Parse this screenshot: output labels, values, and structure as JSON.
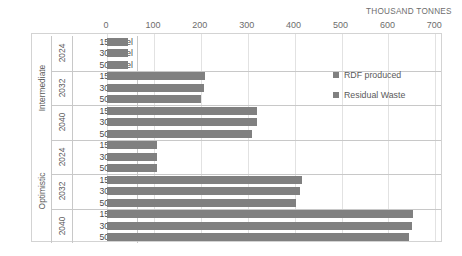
{
  "axis": {
    "units_caption": "THOUSAND TONNES",
    "ticks": [
      0,
      100,
      200,
      300,
      400,
      500,
      600,
      700
    ]
  },
  "legend": {
    "items": [
      {
        "label": "RDF produced",
        "color": "#808080"
      },
      {
        "label": "Residual Waste",
        "color": "#808080"
      }
    ]
  },
  "labels": {
    "scenario_intermediate": "Intermediate",
    "scenario_optimistic": "Optimistic",
    "year_2024": "2024",
    "year_2032": "2032",
    "year_2040": "2040",
    "fuel_15": "15% fuel",
    "fuel_30": "30% fuel",
    "fuel_50": "50% fuel"
  },
  "chart_data": {
    "type": "bar",
    "orientation": "horizontal",
    "title": "",
    "xlabel": "THOUSAND TONNES",
    "ylabel": "",
    "xlim": [
      0,
      700
    ],
    "grid": true,
    "legend_position": "inside-right",
    "xticks": [
      0,
      100,
      200,
      300,
      400,
      500,
      600,
      700
    ],
    "categories": [
      "Intermediate / 2024 / 15% fuel",
      "Intermediate / 2024 / 30% fuel",
      "Intermediate / 2024 / 50% fuel",
      "Intermediate / 2032 / 15% fuel",
      "Intermediate / 2032 / 30% fuel",
      "Intermediate / 2032 / 50% fuel",
      "Intermediate / 2040 / 15% fuel",
      "Intermediate / 2040 / 30% fuel",
      "Intermediate / 2040 / 50% fuel",
      "Optimistic / 2024 / 15% fuel",
      "Optimistic / 2024 / 30% fuel",
      "Optimistic / 2024 / 50% fuel",
      "Optimistic / 2032 / 15% fuel",
      "Optimistic / 2032 / 30% fuel",
      "Optimistic / 2032 / 50% fuel",
      "Optimistic / 2040 / 15% fuel",
      "Optimistic / 2040 / 30% fuel",
      "Optimistic / 2040 / 50% fuel"
    ],
    "series": [
      {
        "name": "Residual Waste",
        "color": "#808080",
        "values": [
          45,
          44,
          44,
          208,
          206,
          200,
          319,
          319,
          310,
          107,
          107,
          106,
          415,
          411,
          402,
          653,
          651,
          643
        ]
      }
    ],
    "groups": [
      {
        "scenario": "Intermediate",
        "years": [
          {
            "year": "2024",
            "rows": [
              {
                "fuel": "15% fuel",
                "value": 45
              },
              {
                "fuel": "30% fuel",
                "value": 44
              },
              {
                "fuel": "50% fuel",
                "value": 44
              }
            ]
          },
          {
            "year": "2032",
            "rows": [
              {
                "fuel": "15% fuel",
                "value": 208
              },
              {
                "fuel": "30% fuel",
                "value": 206
              },
              {
                "fuel": "50% fuel",
                "value": 200
              }
            ]
          },
          {
            "year": "2040",
            "rows": [
              {
                "fuel": "15% fuel",
                "value": 319
              },
              {
                "fuel": "30% fuel",
                "value": 319
              },
              {
                "fuel": "50% fuel",
                "value": 310
              }
            ]
          }
        ]
      },
      {
        "scenario": "Optimistic",
        "years": [
          {
            "year": "2024",
            "rows": [
              {
                "fuel": "15% fuel",
                "value": 107
              },
              {
                "fuel": "30% fuel",
                "value": 107
              },
              {
                "fuel": "50% fuel",
                "value": 106
              }
            ]
          },
          {
            "year": "2032",
            "rows": [
              {
                "fuel": "15% fuel",
                "value": 415
              },
              {
                "fuel": "30% fuel",
                "value": 411
              },
              {
                "fuel": "50% fuel",
                "value": 402
              }
            ]
          },
          {
            "year": "2040",
            "rows": [
              {
                "fuel": "15% fuel",
                "value": 653
              },
              {
                "fuel": "30% fuel",
                "value": 651
              },
              {
                "fuel": "50% fuel",
                "value": 643
              }
            ]
          }
        ]
      }
    ]
  }
}
